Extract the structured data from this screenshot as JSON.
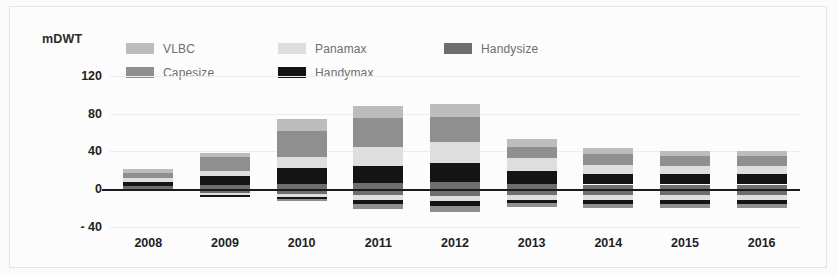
{
  "chart_data": {
    "type": "bar",
    "title": "",
    "subtitle": "",
    "ylabel": "mDWT",
    "xlabel": "",
    "stacked": true,
    "grid": true,
    "legend_position": "top-left",
    "ylim": [
      -40,
      140
    ],
    "yticks": [
      120,
      80,
      40,
      0,
      -40
    ],
    "ytick_labels": [
      "120",
      "80",
      "40",
      "0",
      "- 40"
    ],
    "categories": [
      "2008",
      "2009",
      "2010",
      "2011",
      "2012",
      "2013",
      "2014",
      "2015",
      "2016"
    ],
    "series": [
      {
        "name": "VLBC",
        "color": "#bcbcbc",
        "values": [
          4,
          4,
          12,
          13,
          14,
          8,
          7,
          6,
          6
        ]
      },
      {
        "name": "Capesize",
        "color": "#8f8f8f",
        "values": [
          5,
          15,
          28,
          30,
          26,
          12,
          11,
          10,
          10
        ]
      },
      {
        "name": "Panamax",
        "color": "#dedede",
        "values": [
          4,
          5,
          12,
          20,
          22,
          14,
          10,
          9,
          9
        ]
      },
      {
        "name": "Handymax",
        "color": "#141414",
        "values": [
          5,
          10,
          16,
          18,
          20,
          13,
          11,
          11,
          11
        ]
      },
      {
        "name": "Handysize",
        "color": "#6e6e6e",
        "values": [
          3,
          4,
          6,
          7,
          8,
          6,
          5,
          5,
          5
        ]
      }
    ],
    "negative_series": [
      {
        "name": "Handysize",
        "color": "#6e6e6e",
        "values": [
          -2,
          -4,
          -5,
          -6,
          -7,
          -6,
          -6,
          -6,
          -6
        ]
      },
      {
        "name": "Panamax",
        "color": "#dedede",
        "values": [
          0,
          -2,
          -3,
          -5,
          -5,
          -5,
          -5,
          -5,
          -5
        ]
      },
      {
        "name": "Handymax",
        "color": "#141414",
        "values": [
          0,
          -2,
          -2,
          -5,
          -6,
          -4,
          -5,
          -5,
          -5
        ]
      },
      {
        "name": "Capesize",
        "color": "#8f8f8f",
        "values": [
          0,
          0,
          -2,
          -5,
          -6,
          -4,
          -4,
          -4,
          -4
        ]
      }
    ]
  },
  "legend": {
    "items": [
      {
        "label": "VLBC",
        "color": "#bcbcbc"
      },
      {
        "label": "Panamax",
        "color": "#dedede"
      },
      {
        "label": "Handysize",
        "color": "#6e6e6e"
      },
      {
        "label": "Capesize",
        "color": "#8f8f8f"
      },
      {
        "label": "Handymax",
        "color": "#141414"
      }
    ]
  },
  "axis": {
    "unit_label": "mDWT"
  },
  "colors": {
    "zero_line": "#1b1b1b",
    "grid": "#ececec",
    "background": "#fcfcfc",
    "frame": "#e4e4e4"
  }
}
